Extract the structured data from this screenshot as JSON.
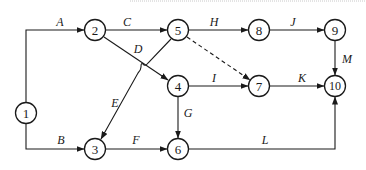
{
  "diagram": {
    "type": "activity-on-arrow network",
    "nodes": [
      {
        "id": "1",
        "label": "1",
        "x": 26,
        "y": 113
      },
      {
        "id": "2",
        "label": "2",
        "x": 95,
        "y": 30
      },
      {
        "id": "3",
        "label": "3",
        "x": 95,
        "y": 149
      },
      {
        "id": "4",
        "label": "4",
        "x": 178,
        "y": 86
      },
      {
        "id": "5",
        "label": "5",
        "x": 178,
        "y": 30
      },
      {
        "id": "6",
        "label": "6",
        "x": 178,
        "y": 149
      },
      {
        "id": "7",
        "label": "7",
        "x": 259,
        "y": 86
      },
      {
        "id": "8",
        "label": "8",
        "x": 259,
        "y": 30
      },
      {
        "id": "9",
        "label": "9",
        "x": 335,
        "y": 30
      },
      {
        "id": "10",
        "label": "10",
        "x": 335,
        "y": 86
      }
    ],
    "edges": [
      {
        "id": "A",
        "label": "A",
        "from": "1",
        "to": "2",
        "style": "solid"
      },
      {
        "id": "B",
        "label": "B",
        "from": "1",
        "to": "3",
        "style": "solid"
      },
      {
        "id": "C",
        "label": "C",
        "from": "2",
        "to": "5",
        "style": "solid"
      },
      {
        "id": "D",
        "label": "D",
        "from": "2",
        "to": "4",
        "style": "solid"
      },
      {
        "id": "E",
        "label": "E",
        "from": "5",
        "to": "3",
        "style": "solid"
      },
      {
        "id": "F",
        "label": "F",
        "from": "3",
        "to": "6",
        "style": "solid"
      },
      {
        "id": "G",
        "label": "G",
        "from": "4",
        "to": "6",
        "style": "solid"
      },
      {
        "id": "H",
        "label": "H",
        "from": "5",
        "to": "8",
        "style": "solid"
      },
      {
        "id": "I",
        "label": "I",
        "from": "4",
        "to": "7",
        "style": "solid"
      },
      {
        "id": "J",
        "label": "J",
        "from": "8",
        "to": "9",
        "style": "solid"
      },
      {
        "id": "K",
        "label": "K",
        "from": "7",
        "to": "10",
        "style": "solid"
      },
      {
        "id": "L",
        "label": "L",
        "from": "6",
        "to": "10",
        "style": "solid"
      },
      {
        "id": "M",
        "label": "M",
        "from": "9",
        "to": "10",
        "style": "solid"
      },
      {
        "id": "dummy",
        "label": "",
        "from": "5",
        "to": "7",
        "style": "dashed"
      }
    ]
  }
}
